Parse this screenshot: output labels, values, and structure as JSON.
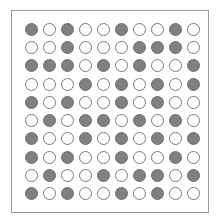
{
  "grid": {
    "rows": 10,
    "cols": 10,
    "filled_color": "#808080",
    "empty_color": "#ffffff",
    "cells": [
      [
        1,
        0,
        1,
        0,
        0,
        1,
        0,
        0,
        1,
        0
      ],
      [
        0,
        0,
        1,
        0,
        0,
        0,
        1,
        1,
        1,
        0
      ],
      [
        1,
        1,
        1,
        0,
        1,
        0,
        1,
        0,
        0,
        1
      ],
      [
        0,
        0,
        0,
        1,
        0,
        1,
        0,
        1,
        0,
        1
      ],
      [
        1,
        0,
        1,
        0,
        0,
        1,
        0,
        1,
        0,
        0
      ],
      [
        0,
        1,
        0,
        1,
        1,
        0,
        1,
        0,
        1,
        0
      ],
      [
        1,
        0,
        0,
        1,
        0,
        1,
        0,
        1,
        0,
        1
      ],
      [
        1,
        0,
        1,
        0,
        0,
        1,
        0,
        0,
        1,
        0
      ],
      [
        0,
        1,
        0,
        0,
        1,
        0,
        1,
        1,
        0,
        1
      ],
      [
        1,
        0,
        1,
        0,
        0,
        1,
        0,
        1,
        0,
        0
      ]
    ]
  }
}
